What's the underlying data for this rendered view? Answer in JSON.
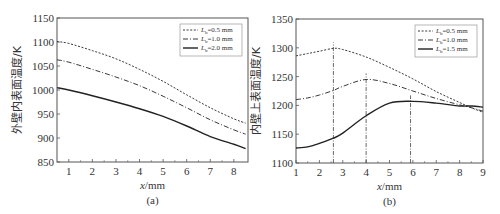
{
  "chart_data": [
    {
      "type": "line",
      "panel_label": "(a)",
      "title": "",
      "xlabel": "x/mm",
      "ylabel": "外壁内表面温度/K",
      "xlim": [
        0.5,
        8.6
      ],
      "ylim": [
        850,
        1150
      ],
      "xticks": [
        1,
        2,
        3,
        4,
        5,
        6,
        7,
        8
      ],
      "yticks": [
        850,
        900,
        950,
        1000,
        1050,
        1100,
        1150
      ],
      "grid": false,
      "legend_position": "upper right",
      "x": [
        0.5,
        1,
        2,
        3,
        4,
        5,
        6,
        7,
        8,
        8.5
      ],
      "series": [
        {
          "name": "L_b=0.5 mm",
          "style": "dotted",
          "values": [
            1101,
            1097,
            1082,
            1065,
            1043,
            1018,
            990,
            963,
            940,
            931
          ]
        },
        {
          "name": "L_b=1.0 mm",
          "style": "dash-dot",
          "values": [
            1063,
            1058,
            1043,
            1027,
            1009,
            987,
            963,
            938,
            917,
            908
          ]
        },
        {
          "name": "L_b=2.0 mm",
          "style": "solid",
          "values": [
            1005,
            1000,
            988,
            975,
            961,
            945,
            925,
            903,
            887,
            878
          ]
        }
      ]
    },
    {
      "type": "line",
      "panel_label": "(b)",
      "title": "",
      "xlabel": "x/mm",
      "ylabel": "内壁上表面温度/K",
      "xlim": [
        1,
        9
      ],
      "ylim": [
        1100,
        1350
      ],
      "xticks": [
        1,
        2,
        3,
        4,
        5,
        6,
        7,
        8,
        9
      ],
      "yticks": [
        1100,
        1150,
        1200,
        1250,
        1300,
        1350
      ],
      "grid": false,
      "legend_position": "upper right",
      "x": [
        1,
        1.5,
        2,
        2.6,
        3,
        4,
        5,
        6,
        7,
        8,
        8.5,
        9
      ],
      "series": [
        {
          "name": "L_b=0.5 mm",
          "style": "dotted",
          "values": [
            1286,
            1290,
            1294,
            1299,
            1297,
            1284,
            1266,
            1246,
            1224,
            1205,
            1196,
            1188
          ]
        },
        {
          "name": "L_b=1.0 mm",
          "style": "dash-dot",
          "values": [
            1210,
            1213,
            1218,
            1226,
            1233,
            1245,
            1238,
            1225,
            1212,
            1201,
            1196,
            1190
          ]
        },
        {
          "name": "L_b=1.5 mm",
          "style": "solid",
          "values": [
            1126,
            1128,
            1134,
            1143,
            1152,
            1182,
            1204,
            1207,
            1204,
            1199,
            1199,
            1197
          ]
        }
      ],
      "annotations": [
        {
          "type": "vline",
          "x": 2.6,
          "style": "dash-dot",
          "note": "peak of L_b=0.5 mm"
        },
        {
          "type": "vline",
          "x": 4.0,
          "style": "dash-dot",
          "note": "peak of L_b=1.0 mm"
        },
        {
          "type": "vline",
          "x": 5.9,
          "style": "dash-dot",
          "note": "peak of L_b=1.5 mm"
        }
      ]
    }
  ],
  "panels": {
    "a": {
      "label": "(a)",
      "xlabel_var": "x",
      "xlabel_unit": "/mm",
      "ylabel": "外壁内表面温度/K",
      "legend": [
        {
          "prefix": "L",
          "sub": "b",
          "text": "=0.5 mm"
        },
        {
          "prefix": "L",
          "sub": "b",
          "text": "=1.0 mm"
        },
        {
          "prefix": "L",
          "sub": "b",
          "text": "=2.0 mm"
        }
      ]
    },
    "b": {
      "label": "(b)",
      "xlabel_var": "x",
      "xlabel_unit": "/mm",
      "ylabel": "内壁上表面温度/K",
      "legend": [
        {
          "prefix": "L",
          "sub": "b",
          "text": "=0.5 mm"
        },
        {
          "prefix": "L",
          "sub": "b",
          "text": "=1.0 mm"
        },
        {
          "prefix": "L",
          "sub": "b",
          "text": "=1.5 mm"
        }
      ]
    }
  }
}
